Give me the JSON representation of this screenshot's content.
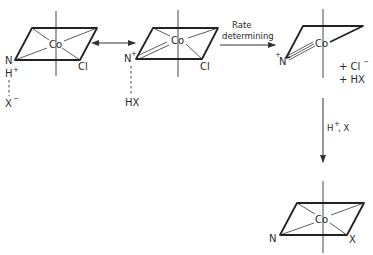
{
  "figure": {
    "type": "reaction-mechanism",
    "species": [
      {
        "id": "complex-1",
        "center": "Co",
        "ligands": [
          "N",
          "Cl"
        ],
        "extra_labels": [
          "H+",
          "X-"
        ]
      },
      {
        "id": "complex-2",
        "center": "Co",
        "ligands": [
          "N+",
          "Cl"
        ],
        "extra_labels": [
          "HX"
        ]
      },
      {
        "id": "complex-3",
        "center": "Co",
        "ligands": [
          "+N"
        ],
        "byproducts": [
          "+ Cl⁻",
          "+ HX"
        ]
      },
      {
        "id": "complex-4",
        "center": "Co",
        "ligands": [
          "N",
          "X"
        ]
      }
    ],
    "arrows": [
      {
        "from": "complex-1",
        "to": "complex-2",
        "type": "resonance",
        "label": ""
      },
      {
        "from": "complex-2",
        "to": "complex-3",
        "type": "forward",
        "label_line1": "Rate",
        "label_line2": "determining"
      },
      {
        "from": "complex-3",
        "to": "complex-4",
        "type": "forward",
        "label": "H⁺, X"
      }
    ]
  },
  "labels": {
    "m1": {
      "co": "Co",
      "n": "N",
      "h": "H",
      "hsup": "+",
      "x": "X",
      "xsup": "−",
      "cl": "Cl"
    },
    "m2": {
      "co": "Co",
      "n": "N",
      "nsup": "+",
      "hx": "HX",
      "cl": "Cl"
    },
    "m3": {
      "co": "Co",
      "nsup": "+",
      "n": "N",
      "cl": "+ Cl",
      "clsup": "−",
      "hx": "+ HX"
    },
    "m4": {
      "co": "Co",
      "n": "N",
      "x": "X"
    },
    "arrow2": {
      "line1": "Rate",
      "line2": "determining"
    },
    "arrow3": {
      "h": "H",
      "hsup": "+",
      "rest": ", X"
    }
  }
}
